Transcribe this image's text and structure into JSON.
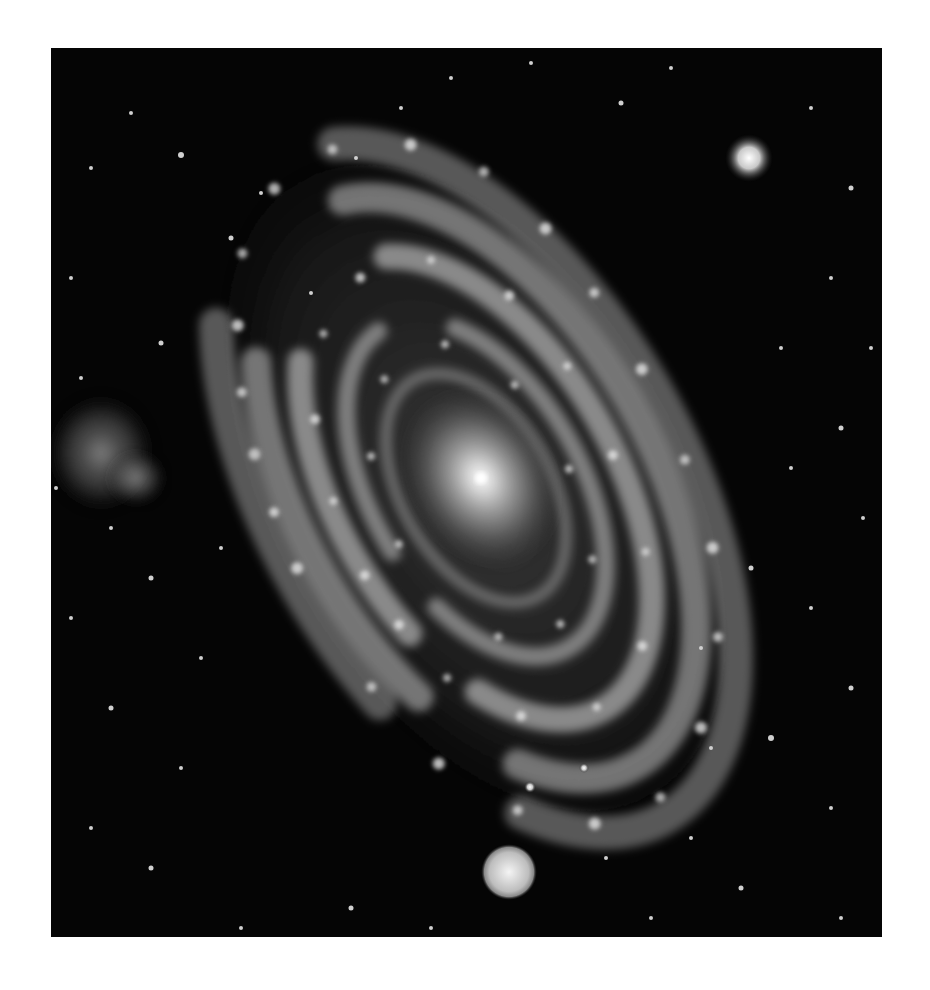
{
  "image": {
    "subject": "spiral galaxy",
    "style": "grayscale astronomical photograph",
    "background_color": "#ffffff",
    "field_color": "#050505",
    "frame": {
      "x": 51,
      "y": 48,
      "width": 831,
      "height": 889
    }
  },
  "features": {
    "galaxy_core": {
      "cx": 430,
      "cy": 430,
      "label": "bright core"
    },
    "companion_nebula": {
      "cx": 50,
      "cy": 405,
      "label": "faint irregular companion"
    },
    "bright_star_top_right": {
      "cx": 698,
      "cy": 110
    },
    "bright_star_bottom": {
      "cx": 458,
      "cy": 824
    }
  }
}
